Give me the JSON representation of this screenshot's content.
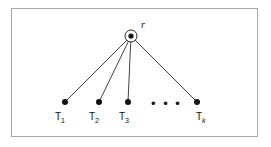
{
  "figure": {
    "type": "tree-diagram",
    "frame": {
      "border_color": "#a8a8a8",
      "background": "#ffffff"
    },
    "ink_color": "#111111",
    "root": {
      "label": "r",
      "circled": true,
      "cx": 131,
      "cy": 36,
      "circle_radius": 6,
      "dot_radius": 2.6
    },
    "leaves": [
      {
        "name": "T1",
        "label_text": "T",
        "subscript": "1",
        "subscript_italic": false,
        "cx": 65,
        "cy": 102,
        "dot_radius": 3.0,
        "label_x": 55,
        "label_y": 112
      },
      {
        "name": "T2",
        "label_text": "T",
        "subscript": "2",
        "subscript_italic": false,
        "cx": 99,
        "cy": 102,
        "dot_radius": 3.0,
        "label_x": 89,
        "label_y": 112
      },
      {
        "name": "T3",
        "label_text": "T",
        "subscript": "3",
        "subscript_italic": false,
        "cx": 128,
        "cy": 102,
        "dot_radius": 3.0,
        "label_x": 119,
        "label_y": 112
      },
      {
        "name": "Tk",
        "label_text": "T",
        "subscript": "k",
        "subscript_italic": true,
        "cx": 197,
        "cy": 102,
        "dot_radius": 3.0,
        "label_x": 196,
        "label_y": 112
      }
    ],
    "ellipsis": {
      "text": "• • •",
      "x": 151,
      "y": 97
    },
    "edges": [
      {
        "from": "root",
        "to": "T1"
      },
      {
        "from": "root",
        "to": "T2"
      },
      {
        "from": "root",
        "to": "T3"
      },
      {
        "from": "root",
        "to": "Tk"
      }
    ],
    "edge_width": 0.8
  }
}
